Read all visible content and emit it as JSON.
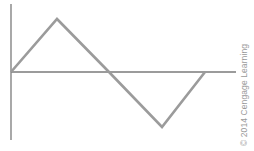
{
  "diagram": {
    "type": "triangle-waveform",
    "axes": {
      "vertical": {
        "x": 11,
        "y1": 4,
        "y2": 140
      },
      "horizontal": {
        "y": 72,
        "x1": 11,
        "x2": 236
      },
      "color": "#7a7a7a"
    },
    "waveform": {
      "points": "11,72 57,19 109,72 162,127 205,72",
      "color": "#9b9b9b",
      "stroke_width": 2.6
    }
  },
  "credit": "© 2014 Cengage Learning"
}
